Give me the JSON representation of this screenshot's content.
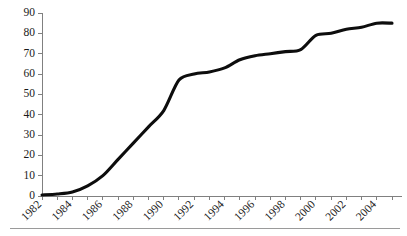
{
  "chart_data": {
    "type": "line",
    "title": "",
    "subtitle": "",
    "xlabel": "",
    "ylabel": "",
    "grid": false,
    "legend": false,
    "legend_position": "none",
    "line_color": "#0d0d0d",
    "axis_color": "#808080",
    "xlim": [
      1982,
      2005
    ],
    "ylim": [
      0,
      90
    ],
    "ytick_values": [
      0,
      10,
      20,
      30,
      40,
      50,
      60,
      70,
      80,
      90
    ],
    "ytick_labels": [
      "0",
      "10",
      "20",
      "30",
      "40",
      "50",
      "60",
      "70",
      "80",
      "90"
    ],
    "xtick_values": [
      1982,
      1983,
      1984,
      1985,
      1986,
      1987,
      1988,
      1989,
      1990,
      1991,
      1992,
      1993,
      1994,
      1995,
      1996,
      1997,
      1998,
      1999,
      2000,
      2001,
      2002,
      2003,
      2004,
      2005
    ],
    "xtick_labels": [
      "1982",
      "",
      "1984",
      "",
      "1986",
      "",
      "1988",
      "",
      "1990",
      "",
      "1992",
      "",
      "1994",
      "",
      "1996",
      "",
      "1998",
      "",
      "2000",
      "",
      "2002",
      "",
      "2004",
      ""
    ],
    "xtick_label_rotation": -45,
    "x": [
      1982,
      1983,
      1984,
      1985,
      1986,
      1987,
      1988,
      1989,
      1990,
      1991,
      1992,
      1993,
      1994,
      1995,
      1996,
      1997,
      1998,
      1999,
      2000,
      2001,
      2002,
      2003,
      2004,
      2005
    ],
    "values": [
      0.5,
      1,
      2,
      5,
      10,
      18,
      26,
      34,
      42,
      57,
      60,
      61,
      63,
      67,
      69,
      70,
      71,
      72,
      79,
      80,
      82,
      83,
      85,
      85
    ]
  },
  "footer": {
    "rule_color": "#9a9a9a"
  }
}
